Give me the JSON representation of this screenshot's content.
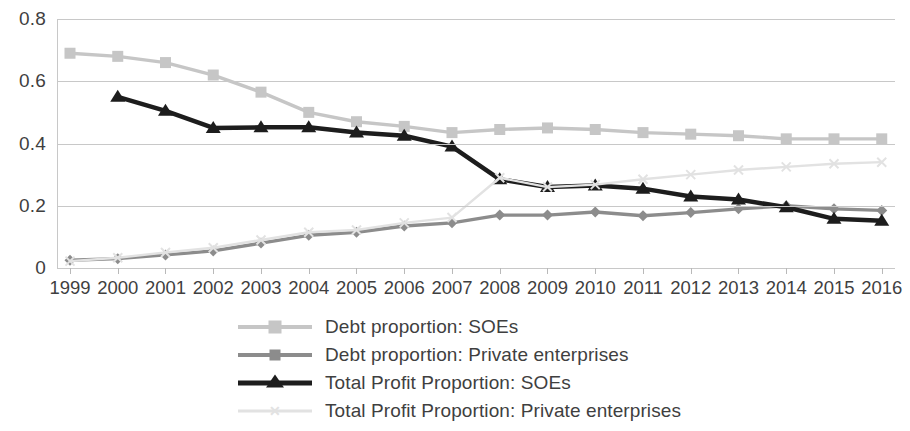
{
  "chart_data": {
    "type": "line",
    "title": "",
    "subtitle": "",
    "xlabel": "",
    "ylabel": "",
    "grid": true,
    "legend_position": "bottom",
    "ylim": [
      0,
      0.8
    ],
    "y_ticks": [
      "0",
      "0.2",
      "0.4",
      "0.6",
      "0.8"
    ],
    "y_tick_values": [
      0,
      0.2,
      0.4,
      0.6,
      0.8
    ],
    "categories": [
      "1999",
      "2000",
      "2001",
      "2002",
      "2003",
      "2004",
      "2005",
      "2006",
      "2007",
      "2008",
      "2009",
      "2010",
      "2011",
      "2012",
      "2013",
      "2014",
      "2015",
      "2016"
    ],
    "x": [
      1999,
      2000,
      2001,
      2002,
      2003,
      2004,
      2005,
      2006,
      2007,
      2008,
      2009,
      2010,
      2011,
      2012,
      2013,
      2014,
      2015,
      2016
    ],
    "series": [
      {
        "name": "Debt proportion: SOEs",
        "marker": "square",
        "color": "#c6c6c6",
        "values": [
          0.69,
          0.68,
          0.66,
          0.62,
          0.565,
          0.5,
          0.47,
          0.455,
          0.435,
          0.445,
          0.45,
          0.445,
          0.435,
          0.43,
          0.425,
          0.415,
          0.415,
          0.415
        ]
      },
      {
        "name": "Debt proportion: Private enterprises",
        "marker": "diamond",
        "color": "#8c8c8c",
        "values": [
          0.025,
          0.03,
          0.042,
          0.055,
          0.08,
          0.105,
          0.115,
          0.135,
          0.145,
          0.17,
          0.17,
          0.18,
          0.168,
          0.178,
          0.19,
          0.2,
          0.19,
          0.185
        ]
      },
      {
        "name": "Total Profit Proportion: SOEs",
        "marker": "triangle",
        "color": "#1d1d1d",
        "values": [
          null,
          0.55,
          0.505,
          0.45,
          0.452,
          0.452,
          0.435,
          0.425,
          0.39,
          0.285,
          0.26,
          0.265,
          0.255,
          0.23,
          0.22,
          0.195,
          0.158,
          0.152
        ]
      },
      {
        "name": "Total Profit Proportion: Private enterprises",
        "marker": "x",
        "color": "#e2e2e2",
        "values": [
          0.022,
          0.033,
          0.05,
          0.065,
          0.09,
          0.115,
          0.122,
          0.145,
          0.162,
          0.29,
          0.26,
          0.268,
          0.285,
          0.3,
          0.315,
          0.325,
          0.335,
          0.34
        ]
      }
    ]
  },
  "legend": {
    "items": [
      {
        "label": "Debt proportion: SOEs",
        "marker": "square-marker",
        "color": "#c6c6c6"
      },
      {
        "label": "Debt proportion: Private enterprises",
        "marker": "diamond-marker",
        "color": "#8c8c8c"
      },
      {
        "label": "Total Profit Proportion: SOEs",
        "marker": "triangle-marker",
        "color": "#1d1d1d"
      },
      {
        "label": "Total Profit Proportion: Private enterprises",
        "marker": "x-marker",
        "color": "#e2e2e2"
      }
    ]
  },
  "colors": {
    "grid": "#c8c8c8",
    "text": "#3f3f3f",
    "background": "#ffffff"
  }
}
